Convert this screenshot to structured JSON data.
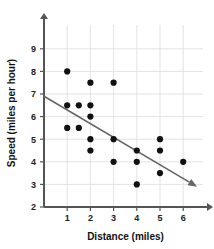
{
  "chart_data": {
    "type": "scatter",
    "title": "",
    "xlabel": "Distance (miles)",
    "ylabel": "Speed (miles per hour)",
    "xlim": [
      0,
      6.9
    ],
    "ylim": [
      2,
      9.6
    ],
    "xticks": [
      1,
      2,
      3,
      4,
      5,
      6
    ],
    "yticks": [
      2,
      3,
      4,
      5,
      6,
      7,
      8,
      9
    ],
    "grid": true,
    "legend": "none",
    "points": [
      {
        "x": 1,
        "y": 8
      },
      {
        "x": 1,
        "y": 6.5
      },
      {
        "x": 1,
        "y": 5.5
      },
      {
        "x": 1.5,
        "y": 6.5
      },
      {
        "x": 1.5,
        "y": 5.5
      },
      {
        "x": 2,
        "y": 7.5
      },
      {
        "x": 2,
        "y": 6.5
      },
      {
        "x": 2,
        "y": 6
      },
      {
        "x": 2,
        "y": 5
      },
      {
        "x": 2,
        "y": 4.5
      },
      {
        "x": 3,
        "y": 7.5
      },
      {
        "x": 3,
        "y": 5
      },
      {
        "x": 3,
        "y": 4
      },
      {
        "x": 4,
        "y": 4.5
      },
      {
        "x": 4,
        "y": 4
      },
      {
        "x": 4,
        "y": 3
      },
      {
        "x": 5,
        "y": 5
      },
      {
        "x": 5,
        "y": 4.5
      },
      {
        "x": 5,
        "y": 3.5
      },
      {
        "x": 6,
        "y": 4
      }
    ],
    "trendline": {
      "x_start": 0,
      "y_start": 6.9,
      "x_end": 6.6,
      "y_end": 2.9,
      "arrow": true
    },
    "colors": {
      "point": "#111111",
      "trendline": "#666666",
      "grid": "#dcdcdc",
      "axis": "#555555",
      "background": "#ffffff"
    }
  },
  "axes": {
    "x_title": "Distance (miles)",
    "y_title": "Speed (miles per hour)",
    "x_tick_labels": [
      "1",
      "2",
      "3",
      "4",
      "5",
      "6"
    ],
    "y_tick_labels": [
      "2",
      "3",
      "4",
      "5",
      "6",
      "7",
      "8",
      "9"
    ]
  }
}
